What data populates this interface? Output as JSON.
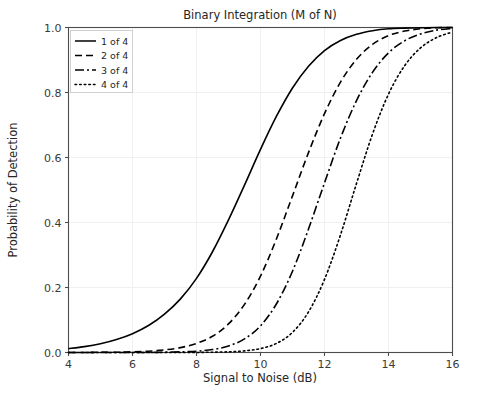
{
  "chart_data": {
    "type": "line",
    "title": "Binary Integration (M of N)",
    "xlabel": "Signal to Noise (dB)",
    "ylabel": "Probability of Detection",
    "xlim": [
      4,
      16
    ],
    "ylim": [
      0.0,
      1.0
    ],
    "xticks": [
      4,
      6,
      8,
      10,
      12,
      14,
      16
    ],
    "xtick_labels": [
      "4",
      "6",
      "8",
      "10",
      "12",
      "14",
      "16"
    ],
    "yticks": [
      0.0,
      0.2,
      0.4,
      0.6,
      0.8,
      1.0
    ],
    "ytick_labels": [
      "0.0",
      "0.2",
      "0.4",
      "0.6",
      "0.8",
      "1.0"
    ],
    "grid": true,
    "legend_position": "upper left",
    "line_color": "#000000",
    "grid_color": "#eeeeee",
    "axis_color": "#4d4d4d",
    "series": [
      {
        "name": "1 of 4",
        "style": "solid",
        "dash": "none",
        "midpoint_db": 9.5,
        "x": [
          4.0,
          4.5,
          5.0,
          5.5,
          6.0,
          6.5,
          7.0,
          7.5,
          8.0,
          8.5,
          9.0,
          9.5,
          10.0,
          10.5,
          11.0,
          11.5,
          12.0,
          12.5,
          13.0,
          13.5,
          14.0,
          14.5,
          15.0,
          15.5,
          16.0
        ],
        "values": [
          0.012,
          0.018,
          0.027,
          0.04,
          0.058,
          0.083,
          0.118,
          0.165,
          0.228,
          0.31,
          0.408,
          0.515,
          0.625,
          0.727,
          0.814,
          0.881,
          0.929,
          0.96,
          0.979,
          0.99,
          0.996,
          0.998,
          0.999,
          1.0,
          1.0
        ]
      },
      {
        "name": "2 of 4",
        "style": "dashed",
        "dash": "7,4",
        "midpoint_db": 10.65,
        "x": [
          4.0,
          4.5,
          5.0,
          5.5,
          6.0,
          6.5,
          7.0,
          7.5,
          8.0,
          8.5,
          9.0,
          9.5,
          10.0,
          10.5,
          11.0,
          11.5,
          12.0,
          12.5,
          13.0,
          13.5,
          14.0,
          14.5,
          15.0,
          15.5,
          16.0
        ],
        "values": [
          0.0,
          0.0,
          0.001,
          0.001,
          0.002,
          0.004,
          0.008,
          0.015,
          0.028,
          0.05,
          0.088,
          0.148,
          0.235,
          0.35,
          0.482,
          0.615,
          0.735,
          0.832,
          0.902,
          0.948,
          0.975,
          0.989,
          0.996,
          0.999,
          1.0
        ]
      },
      {
        "name": "3 of 4",
        "style": "dashdot",
        "dash": "9,3,2,3",
        "midpoint_db": 11.65,
        "x": [
          4.0,
          4.5,
          5.0,
          5.5,
          6.0,
          6.5,
          7.0,
          7.5,
          8.0,
          8.5,
          9.0,
          9.5,
          10.0,
          10.5,
          11.0,
          11.5,
          12.0,
          12.5,
          13.0,
          13.5,
          14.0,
          14.5,
          15.0,
          15.5,
          16.0
        ],
        "values": [
          0.0,
          0.0,
          0.0,
          0.0,
          0.0,
          0.0,
          0.001,
          0.002,
          0.004,
          0.009,
          0.02,
          0.042,
          0.082,
          0.15,
          0.25,
          0.38,
          0.522,
          0.66,
          0.775,
          0.862,
          0.922,
          0.959,
          0.98,
          0.992,
          0.997
        ]
      },
      {
        "name": "4 of 4",
        "style": "dotted",
        "dash": "1.6,3",
        "midpoint_db": 12.8,
        "x": [
          4.0,
          4.5,
          5.0,
          5.5,
          6.0,
          6.5,
          7.0,
          7.5,
          8.0,
          8.5,
          9.0,
          9.5,
          10.0,
          10.5,
          11.0,
          11.5,
          12.0,
          12.5,
          13.0,
          13.5,
          14.0,
          14.5,
          15.0,
          15.5,
          16.0
        ],
        "values": [
          0.0,
          0.0,
          0.0,
          0.0,
          0.0,
          0.0,
          0.0,
          0.0,
          0.0,
          0.001,
          0.002,
          0.005,
          0.012,
          0.028,
          0.062,
          0.125,
          0.225,
          0.362,
          0.52,
          0.672,
          0.795,
          0.882,
          0.937,
          0.969,
          0.986
        ]
      }
    ]
  },
  "legend": {
    "items": [
      {
        "label": "1 of 4"
      },
      {
        "label": "2 of 4"
      },
      {
        "label": "3 of 4"
      },
      {
        "label": "4 of 4"
      }
    ]
  }
}
